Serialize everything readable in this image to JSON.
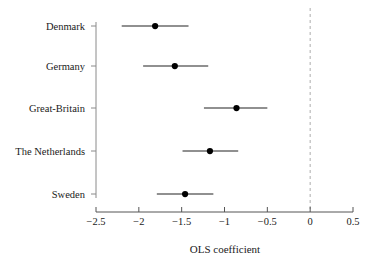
{
  "chart_data": {
    "type": "scatter",
    "title": "",
    "subtitle": "",
    "xlabel": "OLS coefficient",
    "ylabel": "",
    "xlim": [
      -2.5,
      0.5
    ],
    "xticks": [
      -2.5,
      -2,
      -1.5,
      -1,
      -0.5,
      0,
      0.5
    ],
    "xtick_labels": [
      "−2.5",
      "−2",
      "−1.5",
      "−1",
      "−0.5",
      "0",
      "0.5"
    ],
    "grid": false,
    "legend": null,
    "categories": [
      "Denmark",
      "Germany",
      "Great-Britain",
      "The Netherlands",
      "Sweden"
    ],
    "values": [
      -1.81,
      -1.58,
      -0.86,
      -1.17,
      -1.46
    ],
    "ci_low": [
      -2.2,
      -1.95,
      -1.24,
      -1.49,
      -1.79
    ],
    "ci_high": [
      -1.42,
      -1.19,
      -0.5,
      -0.84,
      -1.13
    ],
    "reference_line": {
      "value": 0,
      "style": "dashed",
      "color": "#b4b4b4"
    },
    "marker": {
      "shape": "circle",
      "color": "#000000",
      "size": 5
    },
    "series": [
      {
        "name": "OLS coefficient",
        "category": "Denmark",
        "value": -1.81,
        "ci_low": -2.2,
        "ci_high": -1.42
      },
      {
        "name": "OLS coefficient",
        "category": "Germany",
        "value": -1.58,
        "ci_low": -1.95,
        "ci_high": -1.19
      },
      {
        "name": "OLS coefficient",
        "category": "Great-Britain",
        "value": -0.86,
        "ci_low": -1.24,
        "ci_high": -0.5
      },
      {
        "name": "OLS coefficient",
        "category": "The Netherlands",
        "value": -1.17,
        "ci_low": -1.49,
        "ci_high": -0.84
      },
      {
        "name": "OLS coefficient",
        "category": "Sweden",
        "value": -1.46,
        "ci_low": -1.79,
        "ci_high": -1.13
      }
    ]
  },
  "axes": {
    "x_axis_color": "#555555",
    "y_axis_color": "#888888",
    "line_color": "#222222"
  }
}
